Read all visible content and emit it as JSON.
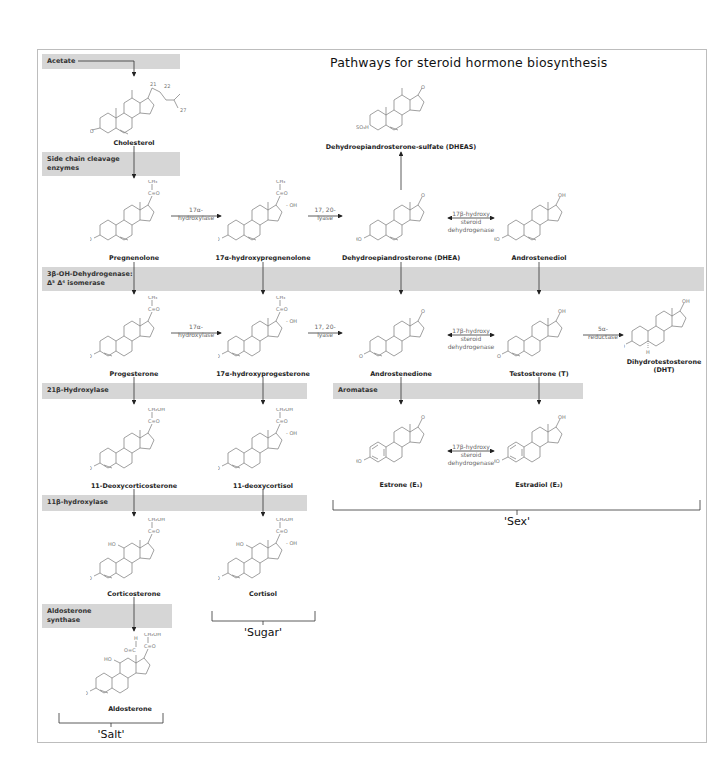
{
  "title": "Pathways for steroid hormone biosynthesis",
  "bands": {
    "acetate": "Acetate",
    "side_chain_1": "Side chain cleavage",
    "side_chain_2": "enzymes",
    "hsd3b_1": "3β-OH-Dehydrogenase:",
    "hsd3b_2": "Δ⁵ Δ⁴ isomerase",
    "cyp21": "21β-Hydroxylase",
    "aromatase": "Aromatase",
    "cyp11b1": "11β-hydroxylase",
    "aldo_1": "Aldosterone",
    "aldo_2": "synthase"
  },
  "compounds": {
    "cholesterol": "Cholesterol",
    "dheas": "Dehydroepiandrosterone-sulfate (DHEAS)",
    "pregnenolone": "Pregnenolone",
    "oh_pregnenolone": "17α-hydroxypregnenolone",
    "dhea": "Dehydroepiandrosterone (DHEA)",
    "androstenediol": "Androstenediol",
    "progesterone": "Progesterone",
    "oh_progesterone": "17α-hydroxyprogesterone",
    "androstenedione": "Androstenedione",
    "testosterone": "Testosterone (T)",
    "dht_1": "Dihydrotestosterone",
    "dht_2": "(DHT)",
    "deoxycorticosterone": "11-Deoxycorticosterone",
    "deoxycortisol": "11-deoxycortisol",
    "estrone": "Estrone (E₁)",
    "estradiol": "Estradiol (E₂)",
    "corticosterone": "Corticosterone",
    "cortisol": "Cortisol",
    "aldosterone": "Aldosterone"
  },
  "enzymes": {
    "hydroxylase17_1": "17α-",
    "hydroxylase17_2": "hydroxylase",
    "lyase_1": "17, 20-",
    "lyase_2": "lyase",
    "hsd17_1": "17β-hydroxy",
    "hsd17_2": "steroid",
    "hsd17_3": "dehydrogenase",
    "reductase_1": "5α-",
    "reductase_2": "reductase"
  },
  "groups": {
    "salt": "'Salt'",
    "sugar": "'Sugar'",
    "sex": "'Sex'"
  },
  "atoms": {
    "ch3": "CH₃",
    "ch2oh": "CH₂OH",
    "co": "C=O",
    "oh": "OH",
    "ho": "HO",
    "o": "O",
    "so3h": "SO₃H",
    "h": "H"
  },
  "colors": {
    "band": "#d6d6d6",
    "frame": "#bdbdbd",
    "structure": "#777777"
  }
}
